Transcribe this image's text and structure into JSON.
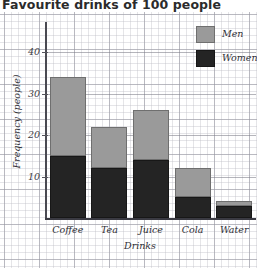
{
  "chart_data": {
    "type": "bar",
    "subtype": "stacked-bar",
    "title": "Favourite drinks of 100 people",
    "xlabel": "Drinks",
    "ylabel": "Frequency (people)",
    "categories": [
      "Coffee",
      "Tea",
      "Juice",
      "Cola",
      "Water"
    ],
    "series": [
      {
        "name": "Women",
        "color": "#242424",
        "values": [
          15,
          12,
          14,
          5,
          3
        ]
      },
      {
        "name": "Men",
        "color": "#9a9a9a",
        "values": [
          19,
          10,
          12,
          7,
          1
        ]
      }
    ],
    "totals": [
      34,
      22,
      26,
      12,
      4
    ],
    "ylim": [
      0,
      44
    ],
    "yticks": [
      10,
      20,
      30,
      40
    ],
    "ytick_labels": [
      "10",
      "20",
      "30",
      "40"
    ],
    "grid": true,
    "gridlines_at": [
      10,
      20,
      30,
      40
    ],
    "legend": {
      "position": "top-right",
      "entries": [
        {
          "label": "Men",
          "color": "#9a9a9a"
        },
        {
          "label": "Women",
          "color": "#242424"
        }
      ]
    },
    "background": "graph-paper"
  }
}
